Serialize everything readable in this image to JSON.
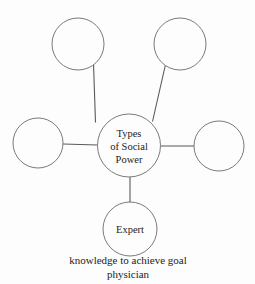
{
  "diagram": {
    "title": "Types of Social Power",
    "center": {
      "label_lines": [
        "Types",
        "of Social",
        "Power"
      ],
      "cx": 129,
      "cy": 145.5,
      "r": 31.5
    },
    "nodes": [
      {
        "name": "top-left-node",
        "label": "",
        "cx": 78,
        "cy": 44,
        "r": 26
      },
      {
        "name": "top-right-node",
        "label": "",
        "cx": 180,
        "cy": 44,
        "r": 26
      },
      {
        "name": "left-node",
        "label": "",
        "cx": 38,
        "cy": 143,
        "r": 25
      },
      {
        "name": "right-node",
        "label": "",
        "cx": 219,
        "cy": 146,
        "r": 25
      },
      {
        "name": "bottom-node",
        "label": "Expert",
        "cx": 130,
        "cy": 229,
        "r": 27
      }
    ],
    "caption": {
      "line1": "knowledge to achieve goal",
      "line2": "physician"
    },
    "colors": {
      "stroke": "#6e6a68",
      "connector": "#5d5957",
      "text": "#262220",
      "background": "#fdfdfd"
    }
  }
}
